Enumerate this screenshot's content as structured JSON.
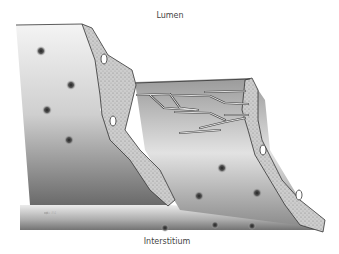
{
  "diagram": {
    "labels": {
      "top": "Lumen",
      "bottom": "Interstitium"
    },
    "signature": "fu 84",
    "style": "grayscale pencil illustration"
  }
}
